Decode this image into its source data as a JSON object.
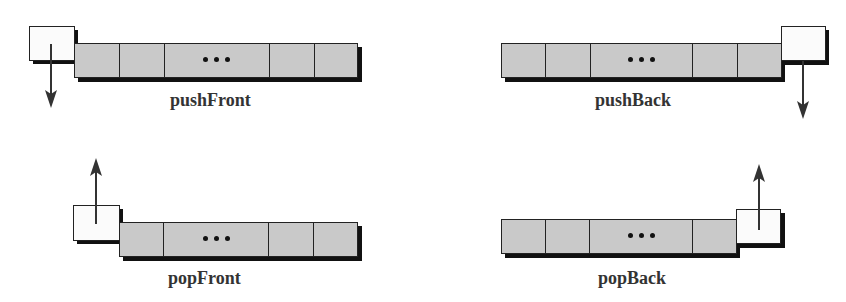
{
  "diagram": {
    "colors": {
      "cell_fill": "#c9c9c9",
      "new_element_fill": "#fbfbfb",
      "outline": "#222222",
      "shadow": "#111111",
      "arrow": "#333333",
      "label": "#333333"
    },
    "ellipsis": "...",
    "panels": [
      {
        "id": "pushFront",
        "label": "pushFront",
        "end": "front",
        "arrow_direction": "down",
        "cells": [
          "",
          "",
          "...",
          "",
          ""
        ]
      },
      {
        "id": "pushBack",
        "label": "pushBack",
        "end": "back",
        "arrow_direction": "down",
        "cells": [
          "",
          "",
          "...",
          "",
          ""
        ]
      },
      {
        "id": "popFront",
        "label": "popFront",
        "end": "front",
        "arrow_direction": "up",
        "cells": [
          "",
          "...",
          "",
          ""
        ]
      },
      {
        "id": "popBack",
        "label": "popBack",
        "end": "back",
        "arrow_direction": "up",
        "cells": [
          "",
          "",
          "...",
          ""
        ]
      }
    ]
  }
}
